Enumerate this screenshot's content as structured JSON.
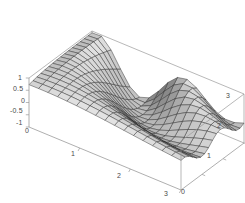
{
  "figure": {
    "kind": "3d-surface-plot",
    "background_color": "#ffffff",
    "frame_color": "#9a9a9a",
    "mesh_color": "#2b2b2b",
    "label_color": "#4a4a4a",
    "width": 245,
    "height": 203
  },
  "chart_data": {
    "type": "surface",
    "title": "",
    "xlabel": "",
    "ylabel": "",
    "zlabel": "",
    "grid": true,
    "legend": false,
    "xlim": [
      0,
      3
    ],
    "ylim": [
      0,
      3
    ],
    "zlim": [
      -1,
      1
    ],
    "x_ticks": [
      0,
      1,
      2,
      3
    ],
    "x_tick_labels": [
      "0",
      "1",
      "2",
      "3"
    ],
    "y_ticks": [
      0,
      1,
      2,
      3
    ],
    "y_tick_labels": [
      "0",
      "1",
      "2",
      "3"
    ],
    "z_ticks": [
      -1,
      -0.5,
      0,
      0.5,
      1
    ],
    "z_tick_labels": [
      "-1",
      "-0.5",
      "0",
      "0.5",
      "1"
    ],
    "x_samples": 17,
    "y_samples": 17,
    "function": "cos(x*y) * exp(-0.35*((x-1.1)^2)) damped ridge surface",
    "view": {
      "azimuth_deg": 38,
      "elevation_deg": 26,
      "projection": "oblique"
    },
    "shading": {
      "light_direction": [
        0.45,
        -0.55,
        0.7
      ],
      "ambient": 0.3,
      "diffuse": 0.7,
      "colormap": "grayscale",
      "min_gray": "#1c1c1c",
      "max_gray": "#f2f2f2"
    },
    "features": [
      {
        "name": "primary-ridge-peak",
        "approx_xy": [
          1.15,
          3.0
        ],
        "approx_z": 1.0
      },
      {
        "name": "secondary-ridge-peak",
        "approx_xy": [
          3.0,
          2.2
        ],
        "approx_z": 0.85
      },
      {
        "name": "valley-trough",
        "approx_xy": [
          2.4,
          2.6
        ],
        "approx_z": -0.95
      },
      {
        "name": "flat-front-plateau",
        "approx_xy": [
          0.4,
          0.4
        ],
        "approx_z": 0.05
      }
    ]
  },
  "axes": {
    "z_axis": {
      "name": "z-axis",
      "ticks": [
        {
          "label": "1",
          "x": 18,
          "y": 74
        },
        {
          "label": "0.5",
          "x": 13,
          "y": 85
        },
        {
          "label": "0",
          "x": 21,
          "y": 97
        },
        {
          "label": "-0.5",
          "x": 10,
          "y": 107
        },
        {
          "label": "-1",
          "x": 16,
          "y": 119
        }
      ]
    },
    "x_axis": {
      "name": "x-axis",
      "ticks": [
        {
          "label": "0",
          "x": 25,
          "y": 127
        },
        {
          "label": "1",
          "x": 71,
          "y": 150
        },
        {
          "label": "2",
          "x": 117,
          "y": 172
        },
        {
          "label": "3",
          "x": 164,
          "y": 190
        }
      ]
    },
    "y_axis": {
      "name": "y-axis",
      "ticks": [
        {
          "label": "0",
          "x": 181,
          "y": 188
        },
        {
          "label": "1",
          "x": 207,
          "y": 152
        },
        {
          "label": "2",
          "x": 217,
          "y": 122
        },
        {
          "label": "3",
          "x": 226,
          "y": 92
        }
      ]
    }
  }
}
